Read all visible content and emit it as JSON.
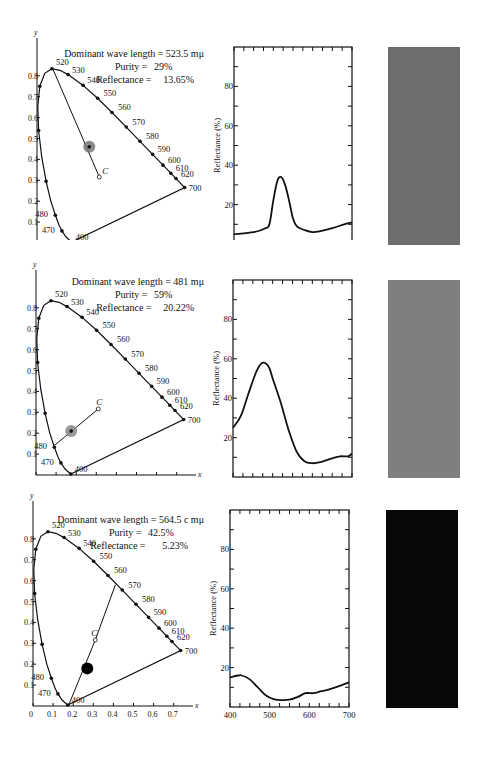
{
  "figure": {
    "panels": [
      {
        "info": {
          "dominant_wavelength_label": "Dominant wave length =",
          "dominant_wavelength_value": "523.5 mμ",
          "purity_label": "Purity =",
          "purity_value": "29%",
          "reflectance_label": "Reflectance =",
          "reflectance_value": "13.65%"
        },
        "swatch_color": "#6e6e6e"
      },
      {
        "info": {
          "dominant_wavelength_label": "Dominant wave length =",
          "dominant_wavelength_value": "481 mμ",
          "purity_label": "Purity =",
          "purity_value": "59%",
          "reflectance_label": "Reflectance =",
          "reflectance_value": "20.22%"
        },
        "swatch_color": "#7f7f7f"
      },
      {
        "info": {
          "dominant_wavelength_label": "Dominant wave length =",
          "dominant_wavelength_value": "564.5 c mμ",
          "purity_label": "Purity =",
          "purity_value": "42.5%",
          "reflectance_label": "Reflectance =",
          "reflectance_value": "5.23%"
        },
        "swatch_color": "#080808"
      }
    ]
  },
  "chart_data": [
    {
      "type": "line",
      "title": "CIE chromaticity diagram (panel 1)",
      "xlabel": "x",
      "ylabel": "y",
      "xticks": [
        "0",
        "0.1",
        "0.2",
        "0.3",
        "0.4",
        "0.5",
        "0.6",
        "0.7"
      ],
      "yticks": [
        "0.1",
        "0.2",
        "0.3",
        "0.4",
        "0.5",
        "0.6",
        "0.7",
        "0.8"
      ],
      "spectrum_locus_labels": [
        "400",
        "470",
        "480",
        "520",
        "530",
        "540",
        "550",
        "560",
        "570",
        "580",
        "590",
        "600",
        "610",
        "620",
        "700"
      ],
      "illuminant_label": "C",
      "illuminant_point": [
        0.31,
        0.316
      ],
      "sample_point": [
        0.26,
        0.46
      ],
      "dominant_line_to": [
        0.08,
        0.83
      ]
    },
    {
      "type": "line",
      "title": "Spectral reflectance (panel 1)",
      "xlabel": "Wavelength (mμ)",
      "ylabel": "Reflectance (%)",
      "xlim": [
        400,
        700
      ],
      "ylim": [
        0,
        100
      ],
      "xticks": [
        "400",
        "500",
        "600",
        "700"
      ],
      "yticks": [
        "20",
        "40",
        "60",
        "80"
      ],
      "x": [
        400,
        450,
        480,
        490,
        500,
        510,
        520,
        530,
        540,
        550,
        560,
        580,
        600,
        620,
        650,
        680,
        700
      ],
      "values": [
        5,
        6,
        8,
        10,
        22,
        32,
        34,
        30,
        22,
        13,
        9,
        7,
        6,
        6.5,
        8,
        10,
        11
      ]
    },
    {
      "type": "line",
      "title": "CIE chromaticity diagram (panel 2)",
      "xlabel": "x",
      "ylabel": "y",
      "xticks": [
        "0",
        "0.1",
        "0.2",
        "0.3",
        "0.4",
        "0.5",
        "0.6",
        "0.7"
      ],
      "yticks": [
        "0.1",
        "0.2",
        "0.3",
        "0.4",
        "0.5",
        "0.6",
        "0.7",
        "0.8"
      ],
      "spectrum_locus_labels": [
        "400",
        "470",
        "480",
        "520",
        "530",
        "540",
        "550",
        "560",
        "570",
        "580",
        "590",
        "600",
        "610",
        "620",
        "700"
      ],
      "illuminant_label": "C",
      "illuminant_point": [
        0.31,
        0.316
      ],
      "sample_point": [
        0.175,
        0.21
      ],
      "dominant_line_to": [
        0.09,
        0.14
      ]
    },
    {
      "type": "line",
      "title": "Spectral reflectance (panel 2)",
      "xlabel": "Wavelength (mμ)",
      "ylabel": "Reflectance (%)",
      "xlim": [
        400,
        700
      ],
      "ylim": [
        0,
        100
      ],
      "xticks": [
        "400",
        "500",
        "600",
        "700"
      ],
      "yticks": [
        "20",
        "40",
        "60",
        "80"
      ],
      "x": [
        400,
        420,
        440,
        460,
        475,
        490,
        500,
        520,
        540,
        560,
        580,
        600,
        620,
        650,
        670,
        690,
        700
      ],
      "values": [
        25,
        31,
        43,
        54,
        58,
        56,
        50,
        38,
        24,
        13,
        8,
        7,
        7.5,
        9.5,
        10.5,
        10.5,
        12
      ]
    },
    {
      "type": "line",
      "title": "CIE chromaticity diagram (panel 3)",
      "xlabel": "x",
      "ylabel": "y",
      "xticks": [
        "0",
        "0.1",
        "0.2",
        "0.3",
        "0.4",
        "0.5",
        "0.6",
        "0.7"
      ],
      "yticks": [
        "0.1",
        "0.2",
        "0.3",
        "0.4",
        "0.5",
        "0.6",
        "0.7",
        "0.8"
      ],
      "spectrum_locus_labels": [
        "400",
        "470",
        "480",
        "520",
        "530",
        "540",
        "550",
        "560",
        "570",
        "580",
        "590",
        "600",
        "610",
        "620",
        "700"
      ],
      "illuminant_label": "C",
      "illuminant_point": [
        0.31,
        0.316
      ],
      "sample_point": [
        0.27,
        0.18
      ],
      "dominant_line_to": [
        0.41,
        0.58
      ],
      "complementary_line_to": [
        0.18,
        0.01
      ]
    },
    {
      "type": "line",
      "title": "Spectral reflectance (panel 3)",
      "xlabel": "Wavelength (mμ)",
      "ylabel": "Reflectance (%)",
      "xlim": [
        400,
        700
      ],
      "ylim": [
        0,
        100
      ],
      "xticks": [
        "400",
        "500",
        "600",
        "700"
      ],
      "yticks": [
        "20",
        "40",
        "60",
        "80"
      ],
      "x": [
        400,
        420,
        430,
        450,
        470,
        490,
        510,
        530,
        550,
        570,
        590,
        610,
        630,
        650,
        680,
        700
      ],
      "values": [
        15,
        16,
        16,
        14,
        10,
        6,
        4,
        3.5,
        3.7,
        5,
        7,
        7,
        8,
        9,
        11,
        12.5
      ]
    }
  ]
}
